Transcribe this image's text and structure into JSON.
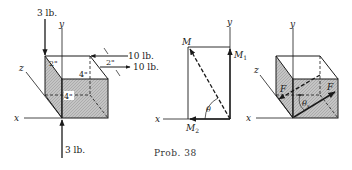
{
  "caption": "Prob. 38",
  "figure1": {
    "axes": {
      "x": "x",
      "y": "y",
      "z": "z"
    },
    "top_force": "3 lb.",
    "bottom_force": "3 lb.",
    "right_force_top": "10 lb.",
    "right_force_bottom": "10 lb.",
    "dim_spacing": "2\"",
    "dim_top_depth": "2\"",
    "dim_top_width": "4\"",
    "dim_front_width": "4\""
  },
  "figure2": {
    "axes": {
      "x": "x",
      "y": "y"
    },
    "resultant": "M",
    "component_y": "M",
    "component_y_sub": "1",
    "component_x": "M",
    "component_x_sub": "2",
    "angle": "θ"
  },
  "figure3": {
    "axes": {
      "x": "x",
      "y": "y",
      "z": "z"
    },
    "force_left": "F",
    "force_right": "F",
    "angle": "θ",
    "angle_sub": "x"
  },
  "colors": {
    "ink": "#1a1a1a",
    "shade": "#b8b8b8"
  }
}
